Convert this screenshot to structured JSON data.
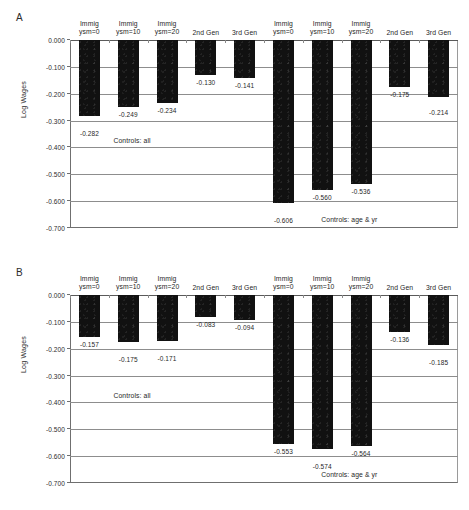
{
  "figure": {
    "panels": [
      {
        "letter": "A",
        "ylabel": "Log Wages",
        "yticks": [
          "0.000",
          "-0.100",
          "-0.200",
          "-0.300",
          "-0.400",
          "-0.500",
          "-0.600",
          "-0.700"
        ],
        "ytick_values": [
          0.0,
          -0.1,
          -0.2,
          -0.3,
          -0.4,
          -0.5,
          -0.6,
          -0.7
        ],
        "groups": [
          {
            "note": "Controls: all"
          },
          {
            "note": "Controls: age & yr"
          }
        ],
        "categories": [
          {
            "line1": "Immig",
            "line2": "ysm=0"
          },
          {
            "line1": "Immig",
            "line2": "ysm=10"
          },
          {
            "line1": "Immig",
            "line2": "ysm=20"
          },
          {
            "line1": "2nd Gen",
            "line2": ""
          },
          {
            "line1": "3rd Gen",
            "line2": ""
          },
          {
            "line1": "Immig",
            "line2": "ysm=0"
          },
          {
            "line1": "Immig",
            "line2": "ysm=10"
          },
          {
            "line1": "Immig",
            "line2": "ysm=20"
          },
          {
            "line1": "2nd Gen",
            "line2": ""
          },
          {
            "line1": "3rd Gen",
            "line2": ""
          }
        ],
        "values": [
          -0.282,
          -0.249,
          -0.234,
          -0.13,
          -0.141,
          -0.606,
          -0.56,
          -0.536,
          -0.175,
          -0.214
        ],
        "labels": [
          "-0.282",
          "-0.249",
          "-0.234",
          "-0.130",
          "-0.141",
          "-0.606",
          "-0.560",
          "-0.536",
          "-0.175",
          "-0.214"
        ],
        "label_offsets": [
          14,
          4,
          4,
          4,
          4,
          14,
          4,
          4,
          4,
          12
        ]
      },
      {
        "letter": "B",
        "ylabel": "Log Wages",
        "yticks": [
          "0.000",
          "-0.100",
          "-0.200",
          "-0.300",
          "-0.400",
          "-0.500",
          "-0.600",
          "-0.700"
        ],
        "ytick_values": [
          0.0,
          -0.1,
          -0.2,
          -0.3,
          -0.4,
          -0.5,
          -0.6,
          -0.7
        ],
        "groups": [
          {
            "note": "Controls: all"
          },
          {
            "note": "Controls: age & yr"
          }
        ],
        "categories": [
          {
            "line1": "Immig",
            "line2": "ysm=0"
          },
          {
            "line1": "Immig",
            "line2": "ysm=10"
          },
          {
            "line1": "Immig",
            "line2": "ysm=20"
          },
          {
            "line1": "2nd Gen",
            "line2": ""
          },
          {
            "line1": "3rd Gen",
            "line2": ""
          },
          {
            "line1": "Immig",
            "line2": "ysm=0"
          },
          {
            "line1": "Immig",
            "line2": "ysm=10"
          },
          {
            "line1": "Immig",
            "line2": "ysm=20"
          },
          {
            "line1": "2nd Gen",
            "line2": ""
          },
          {
            "line1": "3rd Gen",
            "line2": ""
          }
        ],
        "values": [
          -0.157,
          -0.175,
          -0.171,
          -0.083,
          -0.094,
          -0.553,
          -0.574,
          -0.564,
          -0.136,
          -0.185
        ],
        "labels": [
          "-0.157",
          "-0.175",
          "-0.171",
          "-0.083",
          "-0.094",
          "-0.553",
          "-0.574",
          "-0.564",
          "-0.136",
          "-0.185"
        ],
        "label_offsets": [
          4,
          14,
          14,
          4,
          4,
          4,
          14,
          4,
          4,
          14
        ]
      }
    ]
  },
  "chart_data": {
    "type": "bar",
    "title": "",
    "xlabel": "",
    "ylabel": "Log Wages",
    "ylim": [
      -0.7,
      0.0
    ],
    "grid": true,
    "legend": "none",
    "panels": [
      {
        "panel": "A",
        "categories": [
          "Immig ysm=0",
          "Immig ysm=10",
          "Immig ysm=20",
          "2nd Gen",
          "3rd Gen",
          "Immig ysm=0",
          "Immig ysm=10",
          "Immig ysm=20",
          "2nd Gen",
          "3rd Gen"
        ],
        "values": [
          -0.282,
          -0.249,
          -0.234,
          -0.13,
          -0.141,
          -0.606,
          -0.56,
          -0.536,
          -0.175,
          -0.214
        ],
        "group_annotations": [
          "Controls: all",
          "Controls: age & yr"
        ],
        "group_split_index": 5
      },
      {
        "panel": "B",
        "categories": [
          "Immig ysm=0",
          "Immig ysm=10",
          "Immig ysm=20",
          "2nd Gen",
          "3rd Gen",
          "Immig ysm=0",
          "Immig ysm=10",
          "Immig ysm=20",
          "2nd Gen",
          "3rd Gen"
        ],
        "values": [
          -0.157,
          -0.175,
          -0.171,
          -0.083,
          -0.094,
          -0.553,
          -0.574,
          -0.564,
          -0.136,
          -0.185
        ],
        "group_annotations": [
          "Controls: all",
          "Controls: age & yr"
        ],
        "group_split_index": 5
      }
    ]
  }
}
